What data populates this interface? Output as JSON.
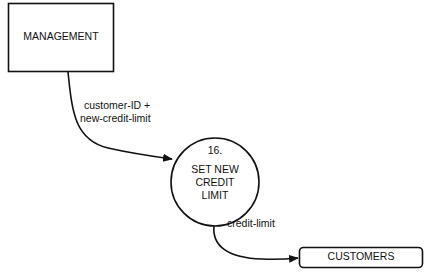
{
  "diagram": {
    "type": "data-flow-diagram",
    "entities": [
      {
        "id": "management",
        "label": "MANAGEMENT",
        "kind": "external-entity"
      },
      {
        "id": "customers",
        "label": "CUSTOMERS",
        "kind": "data-store"
      }
    ],
    "process": {
      "number": "16.",
      "label_lines": [
        "SET NEW",
        "CREDIT",
        "LIMIT"
      ]
    },
    "flows": [
      {
        "from": "management",
        "to": "process",
        "label_lines": [
          "customer-ID +",
          "new-credit-limit"
        ]
      },
      {
        "from": "process",
        "to": "customers",
        "label": "credit-limit"
      }
    ]
  }
}
